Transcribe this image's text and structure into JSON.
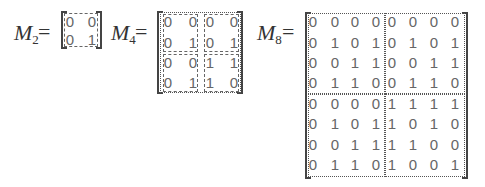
{
  "labels": {
    "m2": {
      "base": "M",
      "sub": "2",
      "eq": "="
    },
    "m4": {
      "base": "M",
      "sub": "4",
      "eq": "="
    },
    "m8": {
      "base": "M",
      "sub": "8",
      "eq": "="
    }
  },
  "matrices": {
    "M2": [
      [
        "0",
        "0"
      ],
      [
        "0",
        "1"
      ]
    ],
    "M4": [
      [
        "0",
        "0",
        "0",
        "0"
      ],
      [
        "0",
        "1",
        "0",
        "1"
      ],
      [
        "0",
        "0",
        "1",
        "1"
      ],
      [
        "0",
        "1",
        "1",
        "0"
      ]
    ],
    "M8": [
      [
        "0",
        "0",
        "0",
        "0",
        "0",
        "0",
        "0",
        "0"
      ],
      [
        "0",
        "1",
        "0",
        "1",
        "0",
        "1",
        "0",
        "1"
      ],
      [
        "0",
        "0",
        "1",
        "1",
        "0",
        "0",
        "1",
        "1"
      ],
      [
        "0",
        "1",
        "1",
        "0",
        "0",
        "1",
        "1",
        "0"
      ],
      [
        "0",
        "0",
        "0",
        "0",
        "1",
        "1",
        "1",
        "1"
      ],
      [
        "0",
        "1",
        "0",
        "1",
        "1",
        "0",
        "1",
        "0"
      ],
      [
        "0",
        "0",
        "1",
        "1",
        "1",
        "1",
        "0",
        "0"
      ],
      [
        "0",
        "1",
        "1",
        "0",
        "1",
        "0",
        "0",
        "1"
      ]
    ]
  }
}
